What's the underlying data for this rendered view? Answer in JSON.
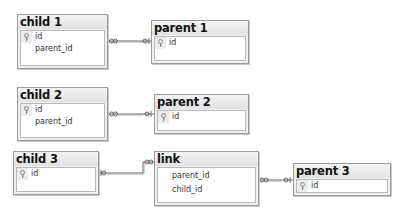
{
  "tables": {
    "child1": {
      "title": "child 1",
      "columns": [
        {
          "name": "id",
          "key": true
        },
        {
          "name": "parent_id",
          "key": false
        }
      ]
    },
    "parent1": {
      "title": "parent 1",
      "columns": [
        {
          "name": "id",
          "key": true
        }
      ]
    },
    "child2": {
      "title": "child 2",
      "columns": [
        {
          "name": "id",
          "key": true
        },
        {
          "name": "parent_id",
          "key": false
        }
      ]
    },
    "parent2": {
      "title": "parent 2",
      "columns": [
        {
          "name": "id",
          "key": true
        }
      ]
    },
    "child3": {
      "title": "child 3",
      "columns": [
        {
          "name": "id",
          "key": true
        }
      ]
    },
    "link": {
      "title": "link",
      "columns": [
        {
          "name": "parent_id",
          "key": false
        },
        {
          "name": "child_id",
          "key": false
        }
      ]
    },
    "parent3": {
      "title": "parent 3",
      "columns": [
        {
          "name": "id",
          "key": true
        }
      ]
    }
  },
  "relationships": [
    {
      "from": "child 1",
      "to": "parent 1",
      "from_end": "many (infinity)",
      "to_end": "one (key)"
    },
    {
      "from": "child 2",
      "to": "parent 2",
      "from_end": "many (infinity)",
      "to_end": "one (key)"
    },
    {
      "from": "link",
      "to": "child 3",
      "from_end": "many (infinity)",
      "to_end": "one (key)"
    },
    {
      "from": "link",
      "to": "parent 3",
      "from_end": "many (infinity)",
      "to_end": "one (key)"
    }
  ],
  "icons": {
    "primary_key": "key-icon"
  },
  "colors": {
    "border": "#9a9a9a",
    "header_bg": "#e8e8e8",
    "line": "#555555"
  }
}
